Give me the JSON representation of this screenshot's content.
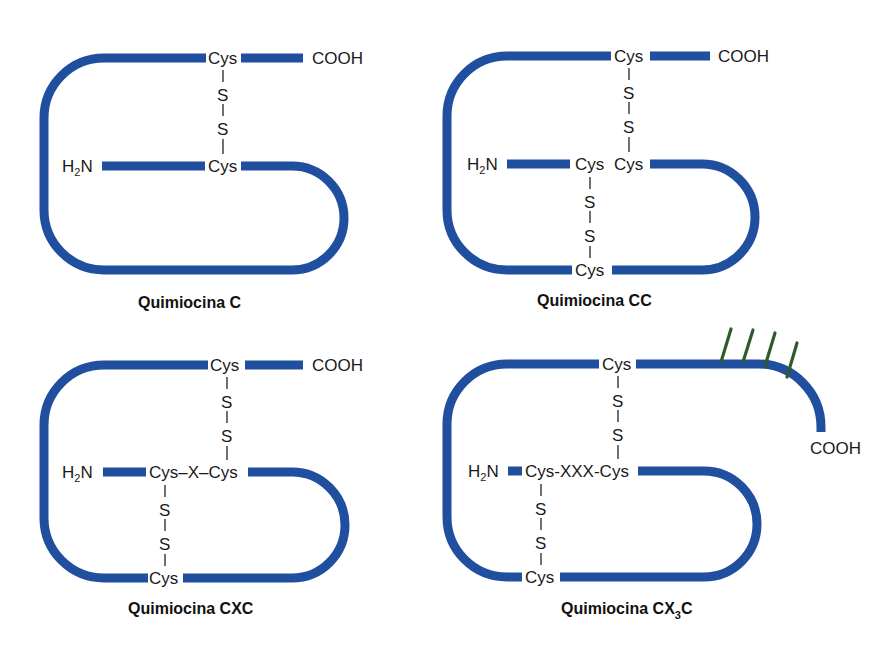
{
  "diagram": {
    "colors": {
      "chain": "#1f4f9e",
      "text": "#1a1a1a",
      "glycosylation": "#2f5a2c",
      "background": "#ffffff"
    },
    "panels": [
      {
        "id": "C",
        "title": "Quimiocina C",
        "n_terminus": "H2N",
        "c_terminus": "COOH",
        "top_cys": "Cys",
        "middle_label": "Cys",
        "disulfide_top": [
          "S",
          "S"
        ]
      },
      {
        "id": "CC",
        "title": "Quimiocina CC",
        "n_terminus": "H2N",
        "c_terminus": "COOH",
        "top_cys": "Cys",
        "middle_left": "Cys",
        "middle_right": "Cys",
        "bottom_cys": "Cys",
        "disulfide_top": [
          "S",
          "S"
        ],
        "disulfide_bottom": [
          "S",
          "S"
        ]
      },
      {
        "id": "CXC",
        "title": "Quimiocina CXC",
        "n_terminus": "H2N",
        "c_terminus": "COOH",
        "top_cys": "Cys",
        "middle_label": "Cys–X–Cys",
        "bottom_cys": "Cys",
        "disulfide_top": [
          "S",
          "S"
        ],
        "disulfide_bottom": [
          "S",
          "S"
        ]
      },
      {
        "id": "CX3C",
        "title_main": "Quimiocina CX",
        "title_sub": "3",
        "title_end": "C",
        "n_terminus": "H2N",
        "c_terminus": "COOH",
        "top_cys": "Cys",
        "middle_label": "Cys-XXX-Cys",
        "bottom_cys": "Cys",
        "disulfide_top": [
          "S",
          "S"
        ],
        "disulfide_bottom": [
          "S",
          "S"
        ],
        "glycosylation_marks": 4
      }
    ],
    "h2n": {
      "h": "H",
      "sub": "2",
      "n": "N"
    }
  }
}
